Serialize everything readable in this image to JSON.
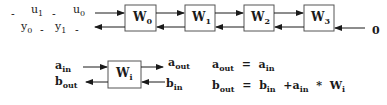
{
  "diagram": {
    "type": "systolic-array",
    "chain": {
      "input_sequence": {
        "u_row": [
          "-",
          "u1",
          "-",
          "u0"
        ],
        "y_row": [
          "y0",
          "-",
          "y1",
          "-"
        ]
      },
      "cells": [
        {
          "id": "W0",
          "base": "W",
          "sub": "0"
        },
        {
          "id": "W1",
          "base": "W",
          "sub": "1"
        },
        {
          "id": "W2",
          "base": "W",
          "sub": "2"
        },
        {
          "id": "W3",
          "base": "W",
          "sub": "3"
        }
      ],
      "right_input": "0"
    },
    "cell_detail": {
      "base": "W",
      "sub": "i",
      "a_in": {
        "base": "a",
        "sub": "in"
      },
      "a_out": {
        "base": "a",
        "sub": "out"
      },
      "b_in": {
        "base": "b",
        "sub": "in"
      },
      "b_out": {
        "base": "b",
        "sub": "out"
      }
    },
    "equations": [
      {
        "lhs_base": "a",
        "lhs_sub": "out",
        "eq": "=",
        "rhs": [
          {
            "base": "a",
            "sub": "in"
          }
        ]
      },
      {
        "lhs_base": "b",
        "lhs_sub": "out",
        "eq": "=",
        "rhs": [
          {
            "base": "b",
            "sub": "in"
          },
          {
            "op": "+"
          },
          {
            "base": "a",
            "sub": "in"
          },
          {
            "op": "*"
          },
          {
            "base": "W",
            "sub": "i"
          }
        ]
      }
    ],
    "equation_text": [
      "a_out = a_in",
      "b_out = b_in + a_in * W_i"
    ],
    "colors": {
      "line": "#1a1a1a",
      "box_border": "#555555"
    }
  }
}
